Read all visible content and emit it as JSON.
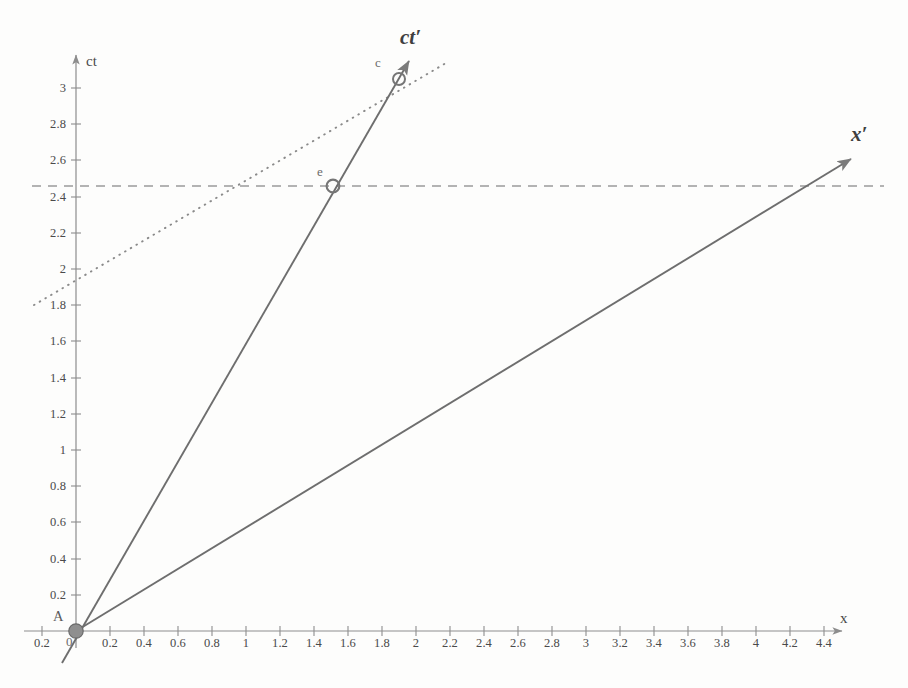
{
  "figure": {
    "kind": "minkowski-spacetime-diagram",
    "background_color": "#fdfdfc",
    "line_color": "#6e6e6e",
    "axis_color": "#8d8d8d",
    "text_color": "#4a4a4a"
  },
  "axes": {
    "x": {
      "name": "x",
      "label_position": "right-end",
      "tick_labels": [
        "0.2",
        "0.2",
        "0.4",
        "0.6",
        "0.8",
        "1",
        "1.2",
        "1.4",
        "1.6",
        "1.8",
        "2",
        "2.2",
        "2.4",
        "2.6",
        "2.8",
        "3",
        "3.2",
        "3.4",
        "3.6",
        "3.8",
        "4",
        "4.2",
        "4.4"
      ],
      "tick_values": [
        -0.2,
        0.2,
        0.4,
        0.6,
        0.8,
        1,
        1.2,
        1.4,
        1.6,
        1.8,
        2,
        2.2,
        2.4,
        2.6,
        2.8,
        3,
        3.2,
        3.4,
        3.6,
        3.8,
        4,
        4.2,
        4.4
      ],
      "range": [
        -0.28,
        4.6
      ],
      "origin_label": "0"
    },
    "ct": {
      "name": "ct",
      "label_position": "top-end",
      "tick_labels": [
        "0.2",
        "0.4",
        "0.6",
        "0.8",
        "1",
        "1.2",
        "1.4",
        "1.6",
        "1.8",
        "2",
        "2.2",
        "2.4",
        "2.6",
        "2.8",
        "3"
      ],
      "tick_values": [
        0.2,
        0.4,
        0.6,
        0.8,
        1,
        1.2,
        1.4,
        1.6,
        1.8,
        2,
        2.2,
        2.4,
        2.6,
        2.8,
        3
      ],
      "range": [
        -0.1,
        3.25
      ]
    }
  },
  "chart_data": {
    "type": "line",
    "title": "",
    "xlabel": "x",
    "ylabel": "ct",
    "xlim": [
      -0.28,
      4.6
    ],
    "ylim": [
      -0.1,
      3.25
    ],
    "grid": false,
    "legend": "none",
    "series": [
      {
        "name": "ct-prime-axis",
        "label": "ct'",
        "style": "solid",
        "arrow": true,
        "points": [
          [
            -0.08,
            -0.18
          ],
          [
            1.92,
            3.12
          ]
        ]
      },
      {
        "name": "x-prime-axis",
        "label": "x'",
        "style": "solid",
        "arrow": true,
        "points": [
          [
            0,
            0
          ],
          [
            4.58,
            2.62
          ]
        ]
      },
      {
        "name": "dotted-line-of-simultaneity",
        "label": "",
        "style": "dotted",
        "arrow": false,
        "points": [
          [
            -0.24,
            1.88
          ],
          [
            2.06,
            3.22
          ]
        ]
      },
      {
        "name": "dashed-horizontal-constant-ct",
        "label": "",
        "style": "dashed",
        "arrow": false,
        "points": [
          [
            -0.26,
            2.5
          ],
          [
            4.64,
            2.5
          ]
        ]
      }
    ],
    "annotations": [
      {
        "name": "A",
        "label": "A",
        "x": 0,
        "y": 0,
        "marker": "filled-circle",
        "label_offset": "above-left"
      },
      {
        "name": "e",
        "label": "e",
        "x": 1.51,
        "y": 2.5,
        "marker": "open-circle",
        "label_offset": "above-left"
      },
      {
        "name": "c",
        "label": "c",
        "x": 1.9,
        "y": 3.09,
        "marker": "open-circle",
        "label_offset": "above-left"
      }
    ]
  },
  "labels": {
    "ct_axis": "ct",
    "x_axis": "x",
    "ct_prime_axis": "ct′",
    "x_prime_axis": "x′",
    "point_A": "A",
    "point_e": "e",
    "point_c": "c",
    "origin": "0"
  }
}
